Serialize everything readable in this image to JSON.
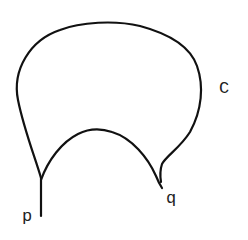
{
  "diagram": {
    "type": "curve-with-cusps",
    "stroke_color": "#111111",
    "background": "#ffffff",
    "labels": {
      "p": "p",
      "q": "q",
      "C": "C"
    },
    "points": {
      "p": {
        "x": 41,
        "y": 178
      },
      "q": {
        "x": 161,
        "y": 188
      }
    }
  }
}
